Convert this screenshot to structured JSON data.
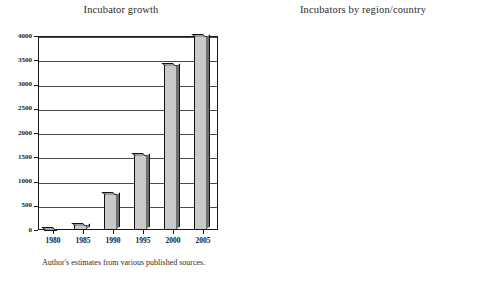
{
  "figure": {
    "caption": "Author's estimates from various published sources."
  },
  "chart_data": [
    {
      "type": "bar",
      "title": "Incubator growth",
      "xlabel": "",
      "ylabel": "",
      "categories": [
        "1980",
        "1985",
        "1990",
        "1995",
        "2000",
        "2005"
      ],
      "values": [
        25,
        110,
        750,
        1550,
        3400,
        4000
      ],
      "ylim": [
        0,
        4000
      ],
      "yticks": [
        0,
        500,
        1000,
        1500,
        2000,
        2500,
        3000,
        3500,
        4000
      ],
      "ytick_labels": [
        "0",
        "500",
        "1000",
        "1500",
        "2000",
        "2500",
        "3000",
        "3500",
        "4000"
      ],
      "grid": true,
      "legend": "none",
      "bar_style": "3d-shaded-gray"
    },
    {
      "type": "bar",
      "title": "Incubators by region/country",
      "xlabel": "",
      "ylabel": "",
      "categories": [
        "US",
        "Germany",
        "Eastern Europe",
        "UK",
        "France",
        "India",
        "Australia",
        "Canada",
        "Israel",
        "Scandinavia",
        "Japan",
        "Thailand",
        "Africa"
      ],
      "values": [
        1000,
        240,
        210,
        145,
        100,
        100,
        45,
        45,
        30,
        20,
        12,
        5,
        2
      ],
      "ylim": [
        0,
        1000
      ],
      "yticks": [
        0,
        100,
        200,
        300,
        400,
        500,
        600,
        700,
        800,
        900,
        1000
      ],
      "ytick_labels": [
        "0",
        "100",
        "200",
        "300",
        "400",
        "500",
        "600",
        "700",
        "800",
        "900",
        "1000"
      ],
      "grid": true,
      "legend": "none",
      "bar_style": "3d-shaded-gray"
    }
  ]
}
